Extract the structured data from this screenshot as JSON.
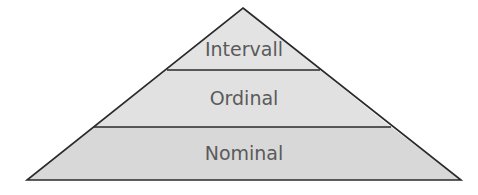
{
  "diagram": {
    "type": "pyramid",
    "tiers": [
      {
        "label": "Intervall",
        "position": "top"
      },
      {
        "label": "Ordinal",
        "position": "middle"
      },
      {
        "label": "Nominal",
        "position": "bottom"
      }
    ],
    "colors": {
      "fill_top": "#e3e3e3",
      "fill_middle": "#e1e1e1",
      "fill_bottom": "#d8d8d8",
      "stroke": "#2a2a2a",
      "text": "#5a5a5a",
      "background": "#ffffff"
    }
  }
}
